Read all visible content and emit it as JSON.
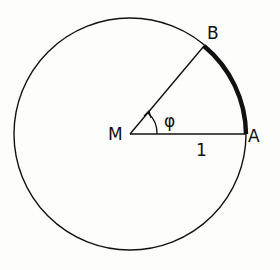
{
  "diagram": {
    "type": "unit-circle-arc",
    "labels": {
      "center": "M",
      "point_a": "A",
      "point_b": "B",
      "angle": "φ",
      "radius": "1"
    },
    "colors": {
      "stroke": "#111111",
      "background": "#fdfdfb"
    }
  }
}
